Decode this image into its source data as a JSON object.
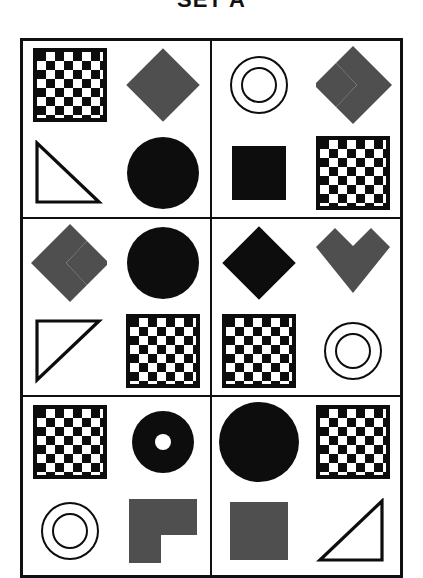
{
  "page": {
    "title": "SET A",
    "kind": "visual-analogy-matrix",
    "background_color": "#ffffff",
    "ink_color": "#0d0d0d",
    "gray_color": "#4f4f4f"
  },
  "grid": {
    "columns": 2,
    "rows": 3,
    "border_color": "#101010",
    "cells": [
      {
        "index": 1,
        "position": "row-1-col-1",
        "shapes": {
          "top_left": {
            "name": "checkerboard-square",
            "label": "checkerboard square"
          },
          "top_right": {
            "name": "gray-diamond",
            "label": "gray diamond"
          },
          "bottom_left": {
            "name": "outline-triangle",
            "label": "white right triangle outline"
          },
          "bottom_right": {
            "name": "black-circle",
            "label": "black circle"
          }
        }
      },
      {
        "index": 2,
        "position": "row-1-col-2",
        "shapes": {
          "top_left": {
            "name": "concentric-rings",
            "label": "concentric rings"
          },
          "top_right": {
            "name": "gray-chevron-right",
            "label": "gray chevron pointing right"
          },
          "bottom_left": {
            "name": "black-square",
            "label": "black square"
          },
          "bottom_right": {
            "name": "checkerboard-square",
            "label": "checkerboard square"
          }
        }
      },
      {
        "index": 3,
        "position": "row-2-col-1",
        "shapes": {
          "top_left": {
            "name": "gray-chevron-left",
            "label": "gray chevron pointing left"
          },
          "top_right": {
            "name": "black-circle",
            "label": "black circle"
          },
          "bottom_left": {
            "name": "outline-triangle",
            "label": "white right triangle outline"
          },
          "bottom_right": {
            "name": "checkerboard-square",
            "label": "checkerboard square"
          }
        }
      },
      {
        "index": 4,
        "position": "row-2-col-2",
        "shapes": {
          "top_left": {
            "name": "black-diamond",
            "label": "black diamond"
          },
          "top_right": {
            "name": "gray-chevron-down",
            "label": "gray chevron pointing down"
          },
          "bottom_left": {
            "name": "checkerboard-square",
            "label": "checkerboard square"
          },
          "bottom_right": {
            "name": "concentric-rings",
            "label": "concentric rings"
          }
        }
      },
      {
        "index": 5,
        "position": "row-3-col-1",
        "shapes": {
          "top_left": {
            "name": "checkerboard-square",
            "label": "checkerboard square"
          },
          "top_right": {
            "name": "black-donut",
            "label": "black donut with small hole"
          },
          "bottom_left": {
            "name": "concentric-rings",
            "label": "concentric rings"
          },
          "bottom_right": {
            "name": "gray-l-shape",
            "label": "gray L shape"
          }
        }
      },
      {
        "index": 6,
        "position": "row-3-col-2",
        "shapes": {
          "top_left": {
            "name": "black-circle",
            "label": "black circle"
          },
          "top_right": {
            "name": "checkerboard-square",
            "label": "checkerboard square"
          },
          "bottom_left": {
            "name": "gray-square",
            "label": "gray square"
          },
          "bottom_right": {
            "name": "outline-triangle",
            "label": "white right triangle outline"
          }
        }
      }
    ]
  }
}
